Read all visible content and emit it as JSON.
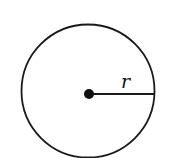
{
  "diagram": {
    "type": "circle-with-radius",
    "radius_label": "r",
    "stroke_color": "#1a1a1a",
    "background": "#ffffff"
  }
}
